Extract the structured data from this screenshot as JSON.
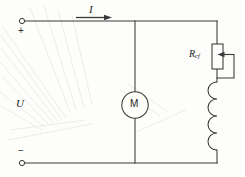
{
  "figure": {
    "type": "electrical-circuit-schematic",
    "background_color": "#fdfdfb",
    "line_color": "#3a3a3a",
    "watermark": "faint radial scan streaks at left edge"
  },
  "labels": {
    "current": "I",
    "voltage": "U",
    "positive_terminal": "+",
    "negative_terminal": "−",
    "rheostat_symbol": "R",
    "rheostat_subscript": "cf",
    "motor_symbol": "M"
  },
  "components": [
    {
      "name": "positive-terminal",
      "kind": "open-terminal",
      "label": "+",
      "position": {
        "x": 22,
        "y": 22
      }
    },
    {
      "name": "negative-terminal",
      "kind": "open-terminal",
      "label": "−",
      "position": {
        "x": 22,
        "y": 163
      }
    },
    {
      "name": "current-arrow",
      "kind": "arrow",
      "label": "I",
      "direction": "right",
      "from": {
        "x": 76,
        "y": 21
      },
      "to": {
        "x": 110,
        "y": 21
      }
    },
    {
      "name": "motor",
      "kind": "circle-symbol",
      "label": "M",
      "center": {
        "x": 135,
        "y": 105
      },
      "radius": 13
    },
    {
      "name": "rheostat",
      "kind": "variable-resistor",
      "label": "R_cf",
      "box": {
        "x": 212,
        "y": 44,
        "width": 11,
        "height": 25
      },
      "wiper_arrow": "points left into resistor body"
    },
    {
      "name": "field-winding",
      "kind": "inductor-coil",
      "arc_count": 4,
      "span": {
        "x": 217,
        "y_top": 82,
        "y_bottom": 150
      },
      "bulge_direction": "left"
    }
  ],
  "wires": {
    "top_rail": {
      "y": 21,
      "x_from": 22,
      "x_to": 217
    },
    "bottom_rail": {
      "y": 163,
      "x_from": 22,
      "x_to": 217
    },
    "motor_branch_x": 135,
    "field_branch_x": 217,
    "rheostat_bypass_x": 234
  }
}
